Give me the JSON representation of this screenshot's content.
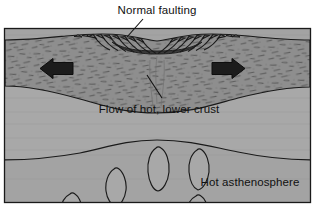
{
  "figure": {
    "type": "geologic-cross-section",
    "background_color": "#ffffff",
    "frame": {
      "x": 4,
      "y": 28,
      "width": 307,
      "height": 175,
      "border_color": "#1a1a1a"
    }
  },
  "labels": {
    "normal_faulting": "Normal faulting",
    "flow_lower_crust": "Flow of hot, lower crust",
    "hot_asthenosphere": "Hot asthenosphere"
  },
  "layers": [
    {
      "name": "upper-crust",
      "label": "Normal faulting",
      "fill": "#8e8e8e",
      "texture": "short-dash-speckle",
      "description": "Brittle upper crust, stippled, thinned and faulted at center"
    },
    {
      "name": "lower-crust",
      "label": "Flow of hot, lower crust",
      "fill": "#a8a8a8",
      "texture": "plain",
      "description": "Ductile lower crust flowing toward the rift axis"
    },
    {
      "name": "asthenosphere",
      "label": "Hot asthenosphere",
      "fill": "#a3a3a3",
      "texture": "diapir-blobs",
      "description": "Hot mantle asthenosphere with rising teardrop diapirs"
    }
  ],
  "arrows": [
    {
      "name": "extension-arrow-left",
      "direction": "left",
      "color": "#1a1a1a",
      "x": 44,
      "y": 68
    },
    {
      "name": "extension-arrow-right",
      "direction": "right",
      "color": "#1a1a1a",
      "x": 212,
      "y": 68
    }
  ],
  "leaders": [
    {
      "name": "leader-normal-faulting",
      "from_label": "Normal faulting",
      "to_feature": "fault-scarps"
    },
    {
      "name": "leader-flow-lower-crust",
      "from_label": "Flow of hot, lower crust",
      "to_feature": "necked-crust"
    }
  ],
  "colors": {
    "upper_crust": "#8e8e8e",
    "lower_crust": "#a8a8a8",
    "asthenosphere": "#a3a3a3",
    "outline": "#1a1a1a",
    "text": "#111111",
    "page": "#ffffff"
  }
}
